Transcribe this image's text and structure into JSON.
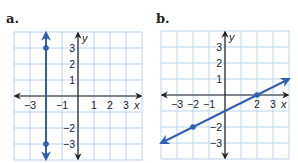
{
  "panels": [
    {
      "label": "a."
    },
    {
      "label": "b."
    }
  ],
  "colors": {
    "grid": "#b9d3ec",
    "axis": "#222222",
    "line": "#2f5fb3"
  },
  "chart_data": [
    {
      "type": "line",
      "title": "a.",
      "xlabel": "x",
      "ylabel": "y",
      "xlim": [
        -4,
        4
      ],
      "ylim": [
        -4,
        4
      ],
      "grid": true,
      "x_tick_labels": [
        "-3",
        "-1",
        "1",
        "2",
        "3"
      ],
      "y_tick_labels": [
        "3",
        "2",
        "1",
        "-2",
        "-3"
      ],
      "series": [
        {
          "name": "vertical line x = -2",
          "points": [
            [
              -2,
              3
            ],
            [
              -2,
              -3
            ]
          ],
          "extends_both_directions": true
        }
      ]
    },
    {
      "type": "line",
      "title": "b.",
      "xlabel": "x",
      "ylabel": "y",
      "xlim": [
        -4,
        4
      ],
      "ylim": [
        -4,
        4
      ],
      "grid": true,
      "x_tick_labels": [
        "-3",
        "-2",
        "-1",
        "2",
        "3"
      ],
      "y_tick_labels": [
        "3",
        "2",
        "1",
        "-2",
        "-3"
      ],
      "series": [
        {
          "name": "line y = 0.5x - 1",
          "points": [
            [
              -2,
              -2
            ],
            [
              2,
              0
            ]
          ],
          "extends_both_directions": true
        }
      ]
    }
  ]
}
